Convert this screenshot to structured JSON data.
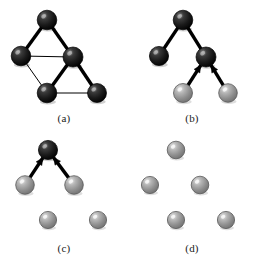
{
  "figure": {
    "type": "diagram",
    "background_color": "#ffffff",
    "panel_count": 4,
    "grid": {
      "columns": 2,
      "rows": 2,
      "panel_width": 128,
      "panel_height": 130
    }
  },
  "styles": {
    "node_dark_color": "#1a1a1a",
    "node_dark_highlight": "#8a8a8a",
    "node_dark_edge": "#000000",
    "node_gray_color": "#8d8d8d",
    "node_gray_highlight": "#e6e6e6",
    "node_gray_edge": "#595959",
    "edge_color": "#000000",
    "edge_thick_width": 3.4,
    "edge_thin_width": 1.0,
    "arrow_color": "#000000",
    "node_radius": 9.5,
    "node_radius_small": 8.2,
    "caption_color": "#1a1a1a"
  },
  "node_layout": {
    "top": {
      "x": 47,
      "y": 20
    },
    "left": {
      "x": 21,
      "y": 56
    },
    "center": {
      "x": 73,
      "y": 57
    },
    "bottom_left": {
      "x": 47,
      "y": 93
    },
    "bottom_right": {
      "x": 97,
      "y": 93
    }
  },
  "panels": [
    {
      "id": "a",
      "caption": "(a)",
      "nodes": [
        {
          "name": "top",
          "x": 47,
          "y": 20,
          "r": 9.8,
          "shade": "dark"
        },
        {
          "name": "left",
          "x": 21,
          "y": 56,
          "r": 9.8,
          "shade": "dark"
        },
        {
          "name": "center",
          "x": 73,
          "y": 57,
          "r": 10.0,
          "shade": "dark"
        },
        {
          "name": "bottom-left",
          "x": 47,
          "y": 93,
          "r": 9.8,
          "shade": "dark"
        },
        {
          "name": "bottom-right",
          "x": 97,
          "y": 93,
          "r": 9.5,
          "shade": "dark"
        }
      ],
      "edges": [
        {
          "from": "top",
          "to": "left",
          "weight": "thick",
          "arrow": false
        },
        {
          "from": "top",
          "to": "center",
          "weight": "thick",
          "arrow": false
        },
        {
          "from": "left",
          "to": "center",
          "weight": "thin",
          "arrow": false
        },
        {
          "from": "left",
          "to": "bottom-left",
          "weight": "thin",
          "arrow": false
        },
        {
          "from": "center",
          "to": "bottom-left",
          "weight": "thick",
          "arrow": false
        },
        {
          "from": "center",
          "to": "bottom-right",
          "weight": "thick",
          "arrow": false
        },
        {
          "from": "bottom-left",
          "to": "bottom-right",
          "weight": "thin",
          "arrow": false
        }
      ]
    },
    {
      "id": "b",
      "caption": "(b)",
      "nodes": [
        {
          "name": "top",
          "x": 55,
          "y": 20,
          "r": 9.8,
          "shade": "dark"
        },
        {
          "name": "left",
          "x": 31,
          "y": 56,
          "r": 9.6,
          "shade": "dark"
        },
        {
          "name": "center",
          "x": 78,
          "y": 57,
          "r": 10.0,
          "shade": "dark"
        },
        {
          "name": "bottom-left",
          "x": 55,
          "y": 93,
          "r": 9.5,
          "shade": "gray"
        },
        {
          "name": "bottom-right",
          "x": 100,
          "y": 93,
          "r": 9.3,
          "shade": "gray"
        }
      ],
      "edges": [
        {
          "from": "top",
          "to": "left",
          "weight": "thick",
          "arrow": false
        },
        {
          "from": "top",
          "to": "center",
          "weight": "thick",
          "arrow": false
        },
        {
          "from": "bottom-left",
          "to": "center",
          "weight": "thick",
          "arrow": true
        },
        {
          "from": "bottom-right",
          "to": "center",
          "weight": "thick",
          "arrow": true
        }
      ]
    },
    {
      "id": "c",
      "caption": "(c)",
      "nodes": [
        {
          "name": "top",
          "x": 48,
          "y": 150,
          "r": 9.6,
          "shade": "dark"
        },
        {
          "name": "left",
          "x": 25,
          "y": 185,
          "r": 9.3,
          "shade": "gray"
        },
        {
          "name": "center",
          "x": 74,
          "y": 185,
          "r": 9.3,
          "shade": "gray"
        },
        {
          "name": "bottom-left",
          "x": 48,
          "y": 220,
          "r": 8.6,
          "shade": "gray"
        },
        {
          "name": "bottom-right",
          "x": 98,
          "y": 220,
          "r": 8.6,
          "shade": "gray"
        }
      ],
      "edges": [
        {
          "from": "left",
          "to": "top",
          "weight": "thick",
          "arrow": true
        },
        {
          "from": "center",
          "to": "top",
          "weight": "thick",
          "arrow": true
        }
      ]
    },
    {
      "id": "d",
      "caption": "(d)",
      "nodes": [
        {
          "name": "top",
          "x": 48,
          "y": 150,
          "r": 8.8,
          "shade": "gray"
        },
        {
          "name": "left",
          "x": 22,
          "y": 185,
          "r": 8.6,
          "shade": "gray"
        },
        {
          "name": "center",
          "x": 72,
          "y": 185,
          "r": 8.8,
          "shade": "gray"
        },
        {
          "name": "bottom-left",
          "x": 48,
          "y": 220,
          "r": 8.6,
          "shade": "gray"
        },
        {
          "name": "bottom-right",
          "x": 98,
          "y": 220,
          "r": 8.6,
          "shade": "gray"
        }
      ],
      "edges": []
    }
  ]
}
